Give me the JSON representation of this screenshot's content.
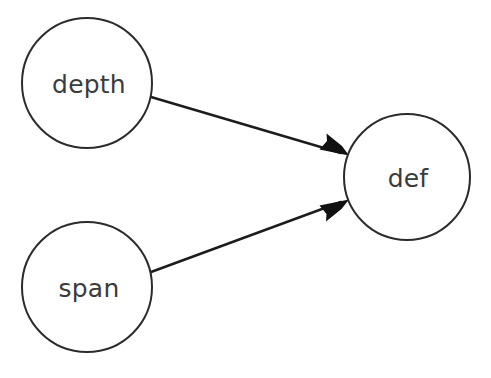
{
  "diagram": {
    "type": "directed-graph",
    "title": "",
    "canvas": {
      "width": 491,
      "height": 378,
      "background": "#ffffff"
    },
    "style": {
      "node_fill": "#ffffff",
      "node_stroke": "#2b2b2b",
      "node_stroke_width": 2,
      "edge_stroke": "#1c1c1c",
      "edge_stroke_width": 2.4,
      "label_color": "#3b3b3b",
      "label_font_size": 25
    },
    "nodes": [
      {
        "id": "depth",
        "label": "depth",
        "shape": "circle",
        "cx": 87,
        "cy": 83,
        "r": 65,
        "label_x": 89,
        "label_y": 84
      },
      {
        "id": "span",
        "label": "span",
        "shape": "circle",
        "cx": 87,
        "cy": 287,
        "r": 65,
        "label_x": 89,
        "label_y": 288
      },
      {
        "id": "def",
        "label": "def",
        "shape": "circle",
        "cx": 407,
        "cy": 177,
        "r": 63,
        "label_x": 408,
        "label_y": 178
      }
    ],
    "edges": [
      {
        "id": "depth-to-def",
        "from": "depth",
        "to": "def",
        "label": "",
        "directed": true,
        "x1": 151,
        "y1": 97,
        "x2": 348,
        "y2": 155,
        "head_points": "348,155 320,147 326,138 328,132"
      },
      {
        "id": "span-to-def",
        "from": "span",
        "to": "def",
        "label": "",
        "directed": true,
        "x1": 151,
        "y1": 272,
        "x2": 348,
        "y2": 200,
        "head_points": "348,200 319,208 326,217 327,222"
      }
    ]
  }
}
